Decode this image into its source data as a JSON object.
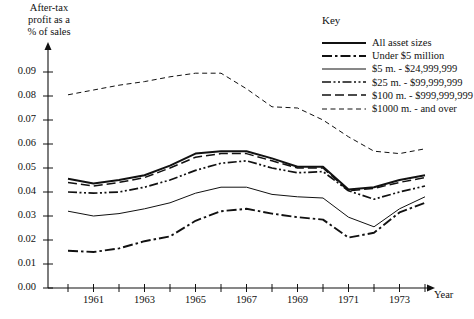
{
  "chart_data": {
    "type": "line",
    "title": "",
    "ylabel": "After-tax\nprofit as a\n% of sales",
    "xlabel": "Year",
    "x": [
      1960,
      1961,
      1962,
      1963,
      1964,
      1965,
      1966,
      1967,
      1968,
      1969,
      1970,
      1971,
      1972,
      1973,
      1974
    ],
    "xlim": [
      1960,
      1974
    ],
    "ylim": [
      0.0,
      0.095
    ],
    "grid": false,
    "legend_position": "top-right",
    "legend_title": "Key",
    "ytick_labels": [
      "0.09",
      "0.08",
      "0.07",
      "0.06",
      "0.05",
      "0.04",
      "0.03",
      "0.02",
      "0.01",
      "0.00"
    ],
    "ytick_values": [
      0.09,
      0.08,
      0.07,
      0.06,
      0.05,
      0.04,
      0.03,
      0.02,
      0.01,
      0.0
    ],
    "xtick_values": [
      1960,
      1961,
      1962,
      1963,
      1964,
      1965,
      1966,
      1967,
      1968,
      1969,
      1970,
      1971,
      1972,
      1973,
      1974
    ],
    "xtick_labels": [
      "",
      "1961",
      "",
      "1963",
      "",
      "1965",
      "",
      "1967",
      "",
      "1969",
      "",
      "1971",
      "",
      "1973",
      ""
    ],
    "series": [
      {
        "name": "All asset sizes",
        "style": "solid-thick",
        "values": [
          0.0455,
          0.0435,
          0.045,
          0.047,
          0.051,
          0.056,
          0.057,
          0.057,
          0.054,
          0.0505,
          0.0505,
          0.041,
          0.042,
          0.045,
          0.047
        ]
      },
      {
        "name": "Under $5 million",
        "style": "dash-dot-thick",
        "values": [
          0.0155,
          0.015,
          0.0165,
          0.0195,
          0.0215,
          0.028,
          0.032,
          0.033,
          0.031,
          0.0295,
          0.0285,
          0.021,
          0.023,
          0.0315,
          0.0355
        ]
      },
      {
        "name": "$5 m. - $24,999,999",
        "style": "solid-thin",
        "values": [
          0.032,
          0.03,
          0.031,
          0.033,
          0.0355,
          0.0395,
          0.042,
          0.042,
          0.039,
          0.038,
          0.0375,
          0.0295,
          0.0255,
          0.033,
          0.038
        ]
      },
      {
        "name": "$25 m. - $99,999,999",
        "style": "dash-dot-dot",
        "values": [
          0.04,
          0.0395,
          0.04,
          0.042,
          0.045,
          0.049,
          0.052,
          0.053,
          0.05,
          0.048,
          0.0485,
          0.0405,
          0.037,
          0.04,
          0.0425
        ]
      },
      {
        "name": "$100 m. - $999,999,999",
        "style": "dashed-medium",
        "values": [
          0.044,
          0.0425,
          0.044,
          0.046,
          0.05,
          0.0545,
          0.056,
          0.056,
          0.053,
          0.05,
          0.05,
          0.0405,
          0.0415,
          0.044,
          0.046
        ]
      },
      {
        "name": "$1000 m. - and over",
        "style": "dashed-fine",
        "values": [
          0.0805,
          0.0825,
          0.0845,
          0.086,
          0.088,
          0.0895,
          0.0895,
          0.083,
          0.0755,
          0.075,
          0.07,
          0.063,
          0.057,
          0.056,
          0.058
        ]
      }
    ]
  }
}
